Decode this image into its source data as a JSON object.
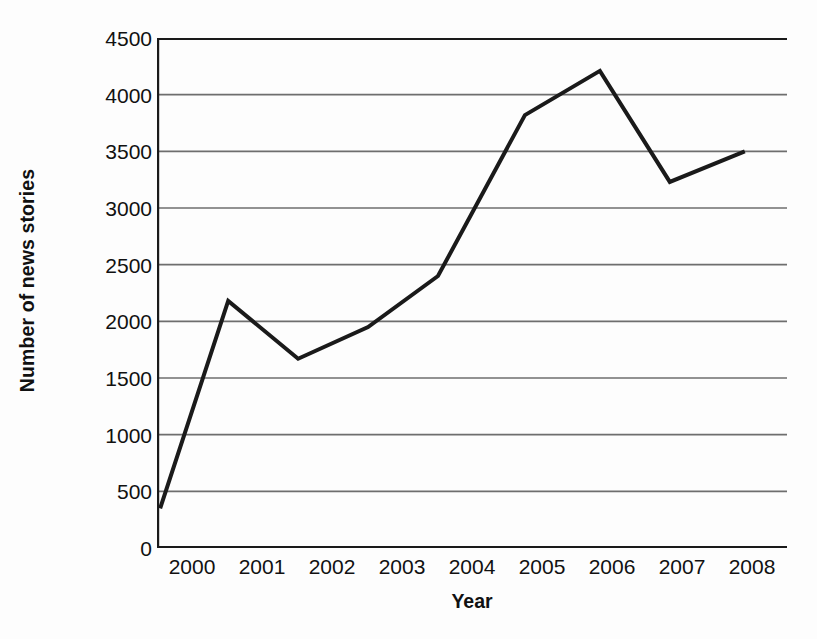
{
  "chart_data": {
    "type": "line",
    "title": "",
    "xlabel": "Year",
    "ylabel": "Number of news stories",
    "categories": [
      "2000",
      "2001",
      "2002",
      "2003",
      "2004",
      "2005",
      "2006",
      "2007",
      "2008"
    ],
    "x": [
      2000,
      2001,
      2002,
      2003,
      2004,
      2005,
      2006,
      2007,
      2008
    ],
    "values": [
      350,
      2180,
      1670,
      1950,
      2400,
      3820,
      4210,
      3230,
      3500
    ],
    "series": [
      {
        "name": "Number of news stories",
        "values": [
          350,
          2180,
          1670,
          1950,
          2400,
          3820,
          4210,
          3230,
          3500
        ]
      }
    ],
    "ylim": [
      0,
      4500
    ],
    "yticks": [
      0,
      500,
      1000,
      1500,
      2000,
      2500,
      3000,
      3500,
      4000,
      4500
    ],
    "ytick_labels": [
      "0",
      "500",
      "1000",
      "1500",
      "2000",
      "2500",
      "3000",
      "3500",
      "4000",
      "4500"
    ],
    "xtick_labels": [
      "2000",
      "2001",
      "2002",
      "2003",
      "2004",
      "2005",
      "2006",
      "2007",
      "2008"
    ],
    "grid": true,
    "grid_axis": "y",
    "legend": false,
    "legend_position": "none",
    "line_color": "#1a1a1a",
    "line_width": 4,
    "markers": false,
    "background_color": "#fdfdfd",
    "axis_color": "#1a1a1a",
    "gridline_color": "#6e6e6e",
    "point_x_fractions": [
      0.005,
      0.113,
      0.224,
      0.335,
      0.446,
      0.584,
      0.703,
      0.814,
      0.933
    ],
    "point_y_values": [
      350,
      2180,
      1670,
      1950,
      2400,
      3820,
      4210,
      3230,
      3500
    ]
  }
}
